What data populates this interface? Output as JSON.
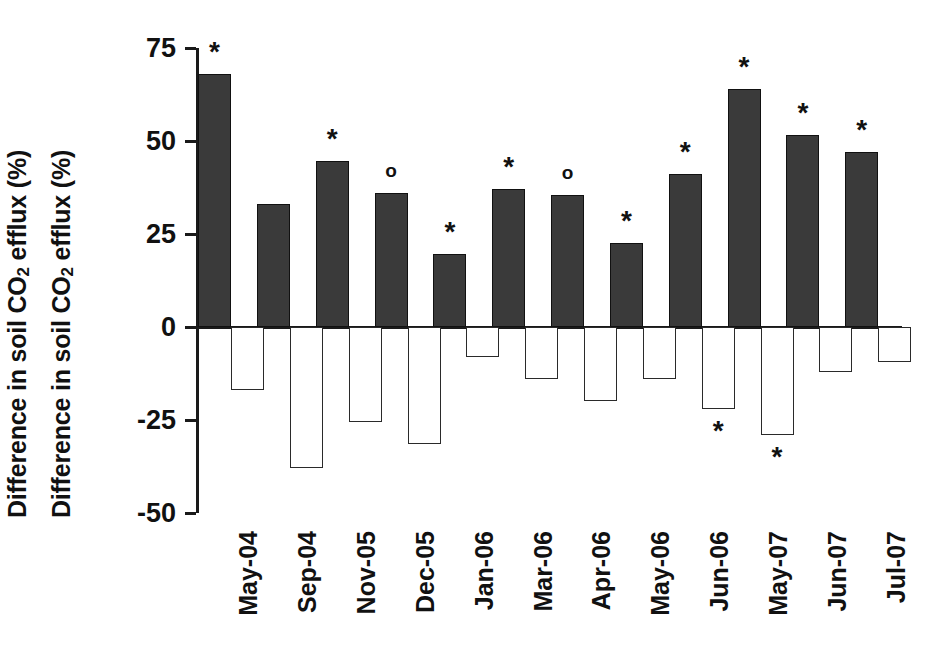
{
  "chart_data": {
    "type": "bar",
    "title": "",
    "subtitle": "",
    "xlabel": "",
    "ylabel": "Difference in soil CO2 efflux (%)",
    "ylabel_2": "Difference in soil CO2 efflux (%)",
    "ylim": [
      -50,
      75
    ],
    "yticks": [
      75,
      50,
      25,
      0,
      -25,
      -50
    ],
    "ytick_labels": [
      "75",
      "50",
      "25",
      "0",
      "-25",
      "-50"
    ],
    "grid": false,
    "legend": "none",
    "categories": [
      "May-04",
      "Sep-04",
      "Nov-05",
      "Dec-05",
      "Jan-06",
      "Mar-06",
      "Apr-06",
      "May-06",
      "Jun-06",
      "May-07",
      "Jun-07",
      "Jul-07"
    ],
    "series": [
      {
        "name": "Positive difference (filled bars)",
        "fill": "#3a3a3a",
        "values": [
          68,
          33,
          44.5,
          36,
          19.5,
          37,
          35.5,
          22.5,
          41,
          64,
          51.5,
          47
        ]
      },
      {
        "name": "Negative difference (open bars)",
        "fill": "#ffffff",
        "values": [
          -17,
          -38,
          -25.5,
          -31.5,
          -8,
          -14,
          -20,
          -14,
          -22,
          -29,
          -12,
          -9.5
        ]
      }
    ],
    "annotations": {
      "positive_markers": [
        "*",
        "",
        "*",
        "o",
        "*",
        "*",
        "o",
        "*",
        "*",
        "*",
        "*",
        "*"
      ],
      "negative_markers": [
        "",
        "",
        "",
        "",
        "",
        "",
        "",
        "",
        "*",
        "*",
        "",
        ""
      ]
    },
    "marker_legend": {
      "asterisk": "*",
      "circle": "o"
    }
  },
  "axis": {
    "y_title_text_pre": "Difference in soil CO",
    "y_title_sub": "2",
    "y_title_text_post": " efflux (%)"
  }
}
